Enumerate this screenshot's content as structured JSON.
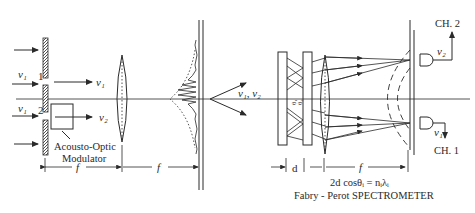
{
  "diagram": {
    "title": "Fabry - Perot SPECTROMETER",
    "equation": "2d cosθᵢ = nᵢλᵢ",
    "labels": {
      "nu1_input": "ν₁",
      "nu1_input2": "ν₁",
      "slit1": "1",
      "slit2": "2",
      "nu1_out": "ν₁",
      "nu2_out": "ν₂",
      "modulator_line1": "Acousto-Optic",
      "modulator_line2": "Modulator",
      "f1": "f",
      "f2": "f",
      "f3": "f",
      "d": "d",
      "combined": "ν₁, ν₂",
      "theta1": "θ₁",
      "theta2": "θ₂",
      "nu2_det": "ν₂",
      "nu1_det": "ν₁",
      "ch2": "CH. 2",
      "ch1": "CH. 1"
    },
    "components": [
      "double-slit-mask",
      "acousto-optic-modulator",
      "lens-1",
      "interference-pattern",
      "fabry-perot-etalon",
      "lens-2",
      "detector-ch2",
      "detector-ch1"
    ]
  }
}
